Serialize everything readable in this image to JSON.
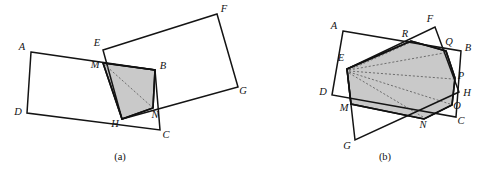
{
  "figure": {
    "kind": "geometry-diagram",
    "width": 490,
    "height": 172,
    "background_color": "#ffffff",
    "stroke_color": "#141414",
    "shade_color": "#c9c9c9",
    "dashed_color": "#5d5d5d"
  },
  "panels": [
    {
      "id": "panel-a",
      "caption": "(a)",
      "caption_pos": {
        "x": 120,
        "y": 158
      },
      "rectangles": [
        {
          "name": "rect-ABCD",
          "vertices": [
            {
              "label": "A",
              "x": 31,
              "y": 52
            },
            {
              "label": "B",
              "x": 155,
              "y": 70
            },
            {
              "label": "C",
              "x": 160,
              "y": 130
            },
            {
              "label": "D",
              "x": 27,
              "y": 113
            }
          ],
          "label_offsets": [
            {
              "label": "A",
              "x": 22,
              "y": 48
            },
            {
              "label": "B",
              "x": 163,
              "y": 67
            },
            {
              "label": "C",
              "x": 166,
              "y": 136
            },
            {
              "label": "D",
              "x": 18,
              "y": 113
            }
          ]
        },
        {
          "name": "rect-EFGH",
          "vertices": [
            {
              "label": "E",
              "x": 103,
              "y": 50
            },
            {
              "label": "F",
              "x": 217,
              "y": 14
            },
            {
              "label": "G",
              "x": 238,
              "y": 87
            },
            {
              "label": "H",
              "x": 122,
              "y": 119
            }
          ],
          "label_offsets": [
            {
              "label": "E",
              "x": 97,
              "y": 44
            },
            {
              "label": "F",
              "x": 224,
              "y": 10
            },
            {
              "label": "G",
              "x": 243,
              "y": 92
            },
            {
              "label": "H",
              "x": 115,
              "y": 125
            }
          ]
        }
      ],
      "intersection_points": [
        {
          "label": "M",
          "x": 103,
          "y": 63,
          "label_x": 95,
          "label_y": 66
        },
        {
          "label": "N",
          "x": 153,
          "y": 108,
          "label_x": 155,
          "label_y": 116
        }
      ],
      "shaded_region": {
        "name": "shaded-quad-MBNH",
        "vertex_labels": [
          "M",
          "B",
          "N",
          "H"
        ],
        "points": [
          {
            "x": 103,
            "y": 63
          },
          {
            "x": 155,
            "y": 70
          },
          {
            "x": 153,
            "y": 108
          },
          {
            "x": 122,
            "y": 119
          }
        ]
      },
      "dashed_segments": [
        {
          "name": "diagonal-M-N",
          "from": {
            "x": 104,
            "y": 64
          },
          "to": {
            "x": 152,
            "y": 107
          }
        }
      ]
    },
    {
      "id": "panel-b",
      "caption": "(b)",
      "caption_pos": {
        "x": 385,
        "y": 158
      },
      "rectangles": [
        {
          "name": "rect-ABCD",
          "vertices": [
            {
              "label": "A",
              "x": 343,
              "y": 31
            },
            {
              "label": "B",
              "x": 461,
              "y": 51
            },
            {
              "label": "C",
              "x": 456,
              "y": 117
            },
            {
              "label": "D",
              "x": 332,
              "y": 95
            }
          ],
          "label_offsets": [
            {
              "label": "A",
              "x": 334,
              "y": 27
            },
            {
              "label": "B",
              "x": 468,
              "y": 49
            },
            {
              "label": "C",
              "x": 461,
              "y": 122
            },
            {
              "label": "D",
              "x": 323,
              "y": 93
            }
          ]
        },
        {
          "name": "rect-EFGH",
          "vertices": [
            {
              "label": "E",
              "x": 347,
              "y": 69
            },
            {
              "label": "F",
              "x": 435,
              "y": 27
            },
            {
              "label": "H",
              "x": 459,
              "y": 92
            },
            {
              "label": "G",
              "x": 355,
              "y": 140
            }
          ],
          "label_offsets": [
            {
              "label": "E",
              "x": 341,
              "y": 59
            },
            {
              "label": "F",
              "x": 430,
              "y": 20
            },
            {
              "label": "H",
              "x": 467,
              "y": 94
            },
            {
              "label": "G",
              "x": 347,
              "y": 147
            }
          ]
        }
      ],
      "intersection_points": [
        {
          "label": "R",
          "x": 411,
          "y": 41,
          "label_x": 405,
          "label_y": 35
        },
        {
          "label": "Q",
          "x": 446,
          "y": 51,
          "label_x": 449,
          "label_y": 43
        },
        {
          "label": "P",
          "x": 455,
          "y": 78,
          "label_x": 461,
          "label_y": 77
        },
        {
          "label": "O",
          "x": 452,
          "y": 105,
          "label_x": 457,
          "label_y": 107
        },
        {
          "label": "N",
          "x": 424,
          "y": 119,
          "label_x": 423,
          "label_y": 126
        },
        {
          "label": "M",
          "x": 351,
          "y": 104,
          "label_x": 344,
          "label_y": 109
        }
      ],
      "shaded_region": {
        "name": "shaded-hexagon-ERQPON-M",
        "vertex_labels": [
          "E",
          "R",
          "Q",
          "P",
          "O",
          "N",
          "M"
        ],
        "points": [
          {
            "x": 347,
            "y": 69
          },
          {
            "x": 411,
            "y": 41
          },
          {
            "x": 446,
            "y": 51
          },
          {
            "x": 455,
            "y": 78
          },
          {
            "x": 452,
            "y": 105
          },
          {
            "x": 424,
            "y": 119
          },
          {
            "x": 351,
            "y": 104
          }
        ]
      },
      "dashed_segments": [
        {
          "name": "ray-E-R",
          "from": {
            "x": 349,
            "y": 70
          },
          "to": {
            "x": 409,
            "y": 43
          }
        },
        {
          "name": "ray-E-Q",
          "from": {
            "x": 349,
            "y": 70
          },
          "to": {
            "x": 444,
            "y": 53
          }
        },
        {
          "name": "ray-E-P",
          "from": {
            "x": 349,
            "y": 71
          },
          "to": {
            "x": 453,
            "y": 79
          }
        },
        {
          "name": "ray-E-O",
          "from": {
            "x": 349,
            "y": 72
          },
          "to": {
            "x": 450,
            "y": 104
          }
        },
        {
          "name": "ray-E-N",
          "from": {
            "x": 349,
            "y": 73
          },
          "to": {
            "x": 423,
            "y": 117
          }
        }
      ]
    }
  ]
}
